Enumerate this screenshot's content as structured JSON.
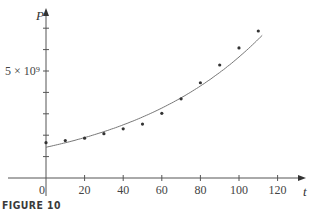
{
  "chart_data": {
    "type": "scatter",
    "title": "",
    "caption": "FIGURE 10",
    "xlabel": "t",
    "ylabel": "P",
    "xlim": [
      -20,
      130
    ],
    "ylim": [
      0,
      7500000000.0
    ],
    "x_ticks": [
      20,
      40,
      60,
      80,
      100,
      120
    ],
    "x_tick_labels": [
      "0",
      "20",
      "40",
      "60",
      "80",
      "100",
      "120"
    ],
    "y_ticks": [
      1000000000.0,
      2000000000.0,
      3000000000.0,
      4000000000.0,
      5000000000.0,
      6000000000.0,
      7000000000.0
    ],
    "y_tick_labels": [
      {
        "value": 5000000000.0,
        "label": "5 × 10⁹"
      }
    ],
    "grid": false,
    "series": [
      {
        "name": "population data",
        "kind": "points",
        "x": [
          0,
          10,
          20,
          30,
          40,
          50,
          60,
          70,
          80,
          90,
          100,
          110
        ],
        "y": [
          1650000000.0,
          1750000000.0,
          1860000000.0,
          2070000000.0,
          2300000000.0,
          2520000000.0,
          3020000000.0,
          3700000000.0,
          4450000000.0,
          5280000000.0,
          6080000000.0,
          6870000000.0
        ]
      },
      {
        "name": "exponential model",
        "kind": "curve",
        "equation": "P = 1.436e9 * 1.0138^t",
        "x_range": [
          0,
          112
        ]
      }
    ]
  },
  "labels": {
    "y_axis": "P",
    "x_axis": "t",
    "origin": "0",
    "y_tick_5e9": "5 × 10⁹",
    "caption": "FIGURE 10"
  }
}
